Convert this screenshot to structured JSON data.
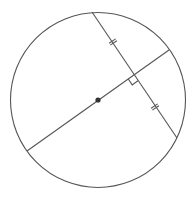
{
  "diagram": {
    "type": "geometry",
    "colors": {
      "stroke": "#555555",
      "center_dot": "#333333",
      "background": "#ffffff"
    },
    "circle": {
      "cx": 98,
      "cy": 100,
      "r": 87.5
    },
    "center_point": {
      "x": 98,
      "y": 100,
      "r": 2.6
    },
    "diameter": {
      "x1": 27,
      "y1": 151,
      "x2": 169,
      "y2": 50
    },
    "chord": {
      "x1": 92,
      "y1": 12,
      "x2": 177,
      "y2": 138
    },
    "right_angle_marker": {
      "vertex": [
        134,
        75
      ],
      "size": 7
    },
    "tick_marks": [
      {
        "at": [
          113,
          42
        ],
        "count": 2
      },
      {
        "at": [
          155,
          107
        ],
        "count": 2
      }
    ]
  }
}
